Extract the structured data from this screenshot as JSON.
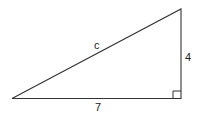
{
  "diagram": {
    "type": "right-triangle",
    "labels": {
      "hypotenuse": "c",
      "vertical_leg": "4",
      "horizontal_leg": "7"
    },
    "right_angle_marker": true,
    "colors": {
      "stroke": "#333333",
      "background": "#ffffff"
    }
  }
}
